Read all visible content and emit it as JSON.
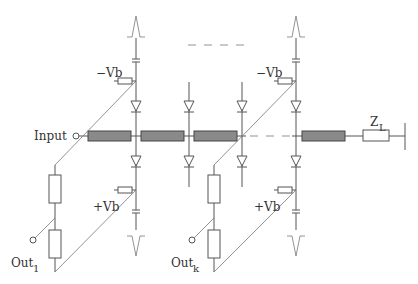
{
  "diagram": {
    "type": "circuit-schematic",
    "labels": {
      "input": "Input",
      "bias_neg_1": "−Vb",
      "bias_pos_1": "+Vb",
      "bias_neg_k": "−Vb",
      "bias_pos_k": "+Vb",
      "out_1": "Out",
      "out_1_sub": "1",
      "out_k": "Out",
      "out_k_sub": "k",
      "load": "Z",
      "load_sub": "L"
    },
    "components": {
      "transmission_line_segments": 4,
      "diodes": 8,
      "bias_resistors": 4,
      "output_resistors": 4,
      "coupling_capacitors": 4,
      "load_impedance": "Z_L",
      "pulses": [
        "positive pulse top-left",
        "negative pulse bottom-left",
        "positive pulse top-right",
        "negative pulse bottom-right"
      ]
    }
  }
}
